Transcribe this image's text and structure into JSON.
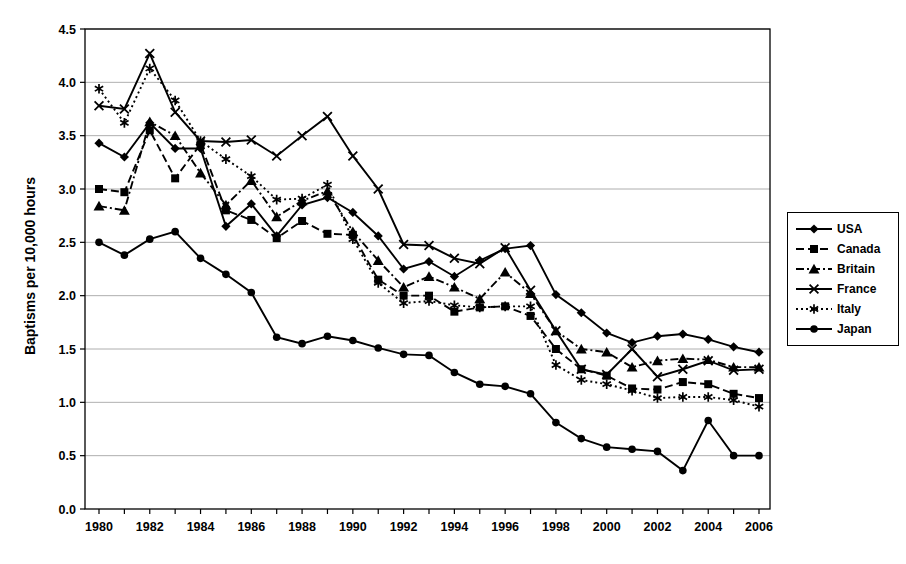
{
  "chart_data": {
    "type": "line",
    "title": "",
    "xlabel": "",
    "ylabel": "Baptisms per 10,000 hours",
    "x": [
      1980,
      1981,
      1982,
      1983,
      1984,
      1985,
      1986,
      1987,
      1988,
      1989,
      1990,
      1991,
      1992,
      1993,
      1994,
      1995,
      1996,
      1997,
      1998,
      1999,
      2000,
      2001,
      2002,
      2003,
      2004,
      2005,
      2006
    ],
    "x_label_step": 2,
    "ylim": [
      0,
      4.5
    ],
    "ytick_step": 0.5,
    "grid": "horizontal",
    "legend_position": "right",
    "colors": {
      "foreground": "#000000",
      "grid": "#9a9a9a",
      "background": "#ffffff"
    },
    "series": [
      {
        "name": "USA",
        "marker": "diamond",
        "line": "solid",
        "values": [
          3.43,
          3.3,
          3.62,
          3.38,
          3.38,
          2.65,
          2.86,
          2.56,
          2.85,
          2.92,
          2.78,
          2.56,
          2.25,
          2.32,
          2.18,
          2.33,
          2.44,
          2.47,
          2.01,
          1.84,
          1.65,
          1.56,
          1.62,
          1.64,
          1.59,
          1.52,
          1.47
        ]
      },
      {
        "name": "Canada",
        "marker": "square",
        "line": "dashed",
        "values": [
          3.0,
          2.97,
          3.55,
          3.1,
          3.42,
          2.8,
          2.71,
          2.54,
          2.7,
          2.58,
          2.57,
          2.15,
          2.0,
          2.0,
          1.85,
          1.89,
          1.9,
          1.81,
          1.5,
          1.31,
          1.25,
          1.13,
          1.12,
          1.19,
          1.17,
          1.08,
          1.04
        ]
      },
      {
        "name": "Britain",
        "marker": "triangle",
        "line": "dashdot",
        "values": [
          2.84,
          2.8,
          3.63,
          3.5,
          3.15,
          2.85,
          3.08,
          2.74,
          2.89,
          2.98,
          2.6,
          2.33,
          2.08,
          2.18,
          2.08,
          1.97,
          2.22,
          2.02,
          1.67,
          1.5,
          1.47,
          1.33,
          1.39,
          1.41,
          1.4,
          1.33,
          1.33
        ]
      },
      {
        "name": "France",
        "marker": "x",
        "line": "solid",
        "values": [
          3.78,
          3.75,
          4.27,
          3.72,
          3.45,
          3.44,
          3.46,
          3.31,
          3.5,
          3.68,
          3.31,
          3.0,
          2.48,
          2.47,
          2.35,
          2.3,
          2.45,
          2.05,
          1.67,
          1.31,
          1.26,
          1.5,
          1.24,
          1.31,
          1.39,
          1.3,
          1.31
        ]
      },
      {
        "name": "Italy",
        "marker": "asterisk",
        "line": "dotted",
        "values": [
          3.94,
          3.62,
          4.13,
          3.83,
          3.45,
          3.28,
          3.12,
          2.9,
          2.91,
          3.04,
          2.53,
          2.12,
          1.93,
          1.95,
          1.91,
          1.89,
          1.9,
          1.9,
          1.35,
          1.21,
          1.17,
          1.11,
          1.04,
          1.05,
          1.05,
          1.02,
          0.96
        ]
      },
      {
        "name": "Japan",
        "marker": "circle",
        "line": "solid",
        "values": [
          2.5,
          2.38,
          2.53,
          2.6,
          2.35,
          2.2,
          2.03,
          1.61,
          1.55,
          1.62,
          1.58,
          1.51,
          1.45,
          1.44,
          1.28,
          1.17,
          1.15,
          1.08,
          0.81,
          0.66,
          0.58,
          0.56,
          0.54,
          0.36,
          0.83,
          0.5,
          0.5
        ]
      }
    ]
  }
}
